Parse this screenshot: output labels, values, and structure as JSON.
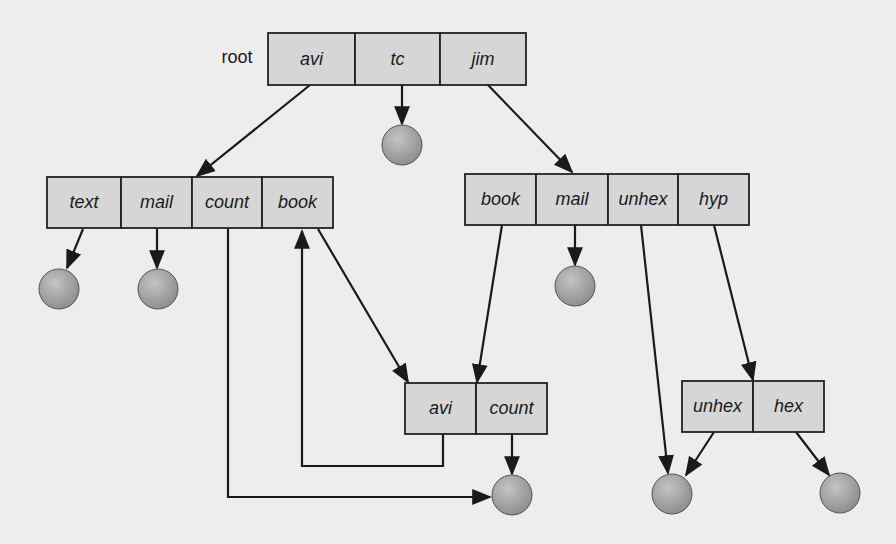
{
  "diagram": {
    "type": "acyclic-graph directory structure",
    "colors": {
      "background": "#ededed",
      "box_fill": "#d6d6d6",
      "box_stroke": "#222222",
      "file_fill": "#a9a9a9",
      "line": "#1a1a1a"
    },
    "root_label": {
      "text": "root",
      "x": 237,
      "y": 58
    },
    "directories": [
      {
        "id": "root",
        "x": 268,
        "y": 33,
        "h": 52,
        "cells": [
          {
            "label": "avi",
            "w": 87
          },
          {
            "label": "tc",
            "w": 85
          },
          {
            "label": "jim",
            "w": 86
          }
        ]
      },
      {
        "id": "avi",
        "x": 47,
        "y": 177,
        "h": 51,
        "cells": [
          {
            "label": "text",
            "w": 74
          },
          {
            "label": "mail",
            "w": 71
          },
          {
            "label": "count",
            "w": 70
          },
          {
            "label": "book",
            "w": 71
          }
        ]
      },
      {
        "id": "jim",
        "x": 465,
        "y": 174,
        "h": 51,
        "cells": [
          {
            "label": "book",
            "w": 71
          },
          {
            "label": "mail",
            "w": 72
          },
          {
            "label": "unhex",
            "w": 70
          },
          {
            "label": "hyp",
            "w": 71
          }
        ]
      },
      {
        "id": "jim-book",
        "x": 405,
        "y": 383,
        "h": 51,
        "cells": [
          {
            "label": "avi",
            "w": 71
          },
          {
            "label": "count",
            "w": 71
          }
        ]
      },
      {
        "id": "jim-hyp",
        "x": 682,
        "y": 381,
        "h": 51,
        "cells": [
          {
            "label": "unhex",
            "w": 71
          },
          {
            "label": "hex",
            "w": 71
          }
        ]
      }
    ],
    "files": [
      {
        "name": "tc-file",
        "cx": 402,
        "cy": 145,
        "r": 20
      },
      {
        "name": "text-file",
        "cx": 59,
        "cy": 289,
        "r": 20
      },
      {
        "name": "mail-file",
        "cx": 158,
        "cy": 289,
        "r": 20
      },
      {
        "name": "jim-mail-file",
        "cx": 575,
        "cy": 286,
        "r": 20
      },
      {
        "name": "count-file",
        "cx": 512,
        "cy": 495,
        "r": 20
      },
      {
        "name": "unhex-file",
        "cx": 672,
        "cy": 494,
        "r": 20
      },
      {
        "name": "hex-file",
        "cx": 840,
        "cy": 493,
        "r": 20
      }
    ],
    "edges": [
      {
        "from": "root.avi",
        "points": [
          [
            310,
            85
          ],
          [
            197,
            176
          ]
        ]
      },
      {
        "from": "root.tc",
        "points": [
          [
            402,
            85
          ],
          [
            402,
            124
          ]
        ]
      },
      {
        "from": "root.jim",
        "points": [
          [
            488,
            85
          ],
          [
            572,
            172
          ]
        ]
      },
      {
        "from": "avi.text",
        "points": [
          [
            83,
            229
          ],
          [
            67,
            268
          ]
        ]
      },
      {
        "from": "avi.mail",
        "points": [
          [
            157,
            229
          ],
          [
            157,
            268
          ]
        ]
      },
      {
        "from": "avi.count",
        "points": [
          [
            228,
            229
          ],
          [
            228,
            497
          ],
          [
            490,
            497
          ]
        ]
      },
      {
        "from": "avi.book",
        "points": [
          [
            318,
            229
          ],
          [
            408,
            382
          ]
        ]
      },
      {
        "from": "jim.book",
        "points": [
          [
            502,
            225
          ],
          [
            477,
            382
          ]
        ]
      },
      {
        "from": "jim.mail",
        "points": [
          [
            575,
            225
          ],
          [
            575,
            265
          ]
        ]
      },
      {
        "from": "jim.unhex",
        "points": [
          [
            641,
            225
          ],
          [
            668,
            473
          ]
        ]
      },
      {
        "from": "jim.hyp",
        "points": [
          [
            714,
            225
          ],
          [
            753,
            380
          ]
        ]
      },
      {
        "from": "jim-book.avi",
        "points": [
          [
            443,
            434
          ],
          [
            443,
            466
          ],
          [
            302,
            466
          ],
          [
            302,
            231
          ]
        ]
      },
      {
        "from": "jim-book.count",
        "points": [
          [
            512,
            434
          ],
          [
            512,
            474
          ]
        ]
      },
      {
        "from": "jim-hyp.unhex",
        "points": [
          [
            714,
            432
          ],
          [
            686,
            475
          ]
        ]
      },
      {
        "from": "jim-hyp.hex",
        "points": [
          [
            796,
            432
          ],
          [
            829,
            475
          ]
        ]
      }
    ]
  }
}
